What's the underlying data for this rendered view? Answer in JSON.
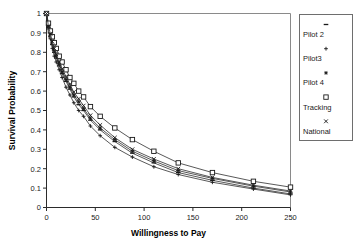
{
  "chart_data": {
    "type": "line",
    "title": "",
    "xlabel": "Willingness to Pay",
    "ylabel": "Survival Probability",
    "xlim": [
      0,
      250
    ],
    "ylim": [
      0,
      1
    ],
    "xticks": [
      0,
      50,
      100,
      150,
      200,
      250
    ],
    "yticks": [
      0,
      0.1,
      0.2,
      0.3,
      0.4,
      0.5,
      0.6,
      0.7,
      0.8,
      0.9,
      1
    ],
    "xticklabels": [
      "0",
      "50",
      "100",
      "150",
      "200",
      "250"
    ],
    "yticklabels": [
      "0",
      "0.1",
      "0.2",
      "0.3",
      "0.4",
      "0.5",
      "0.6",
      "0.7",
      "0.8",
      "0.9",
      "1"
    ],
    "grid": false,
    "legend_position": "outside-right",
    "x": [
      0,
      2,
      4,
      6,
      8,
      10,
      13,
      16,
      20,
      24,
      28,
      33,
      38,
      45,
      55,
      70,
      88,
      110,
      135,
      170,
      212,
      250
    ],
    "series": [
      {
        "name": "Pilot 2",
        "marker": "dash",
        "values": [
          1.0,
          0.93,
          0.88,
          0.84,
          0.8,
          0.77,
          0.73,
          0.69,
          0.65,
          0.61,
          0.57,
          0.53,
          0.5,
          0.45,
          0.4,
          0.34,
          0.28,
          0.23,
          0.18,
          0.14,
          0.1,
          0.07
        ]
      },
      {
        "name": "Pilot3",
        "marker": "plus",
        "values": [
          1.0,
          0.92,
          0.87,
          0.82,
          0.78,
          0.75,
          0.71,
          0.67,
          0.62,
          0.58,
          0.54,
          0.5,
          0.47,
          0.42,
          0.37,
          0.31,
          0.26,
          0.21,
          0.17,
          0.13,
          0.095,
          0.065
        ]
      },
      {
        "name": "Pilot 4",
        "marker": "asterisk",
        "values": [
          1.0,
          0.93,
          0.89,
          0.85,
          0.81,
          0.78,
          0.74,
          0.7,
          0.66,
          0.62,
          0.58,
          0.545,
          0.51,
          0.46,
          0.41,
          0.35,
          0.29,
          0.24,
          0.19,
          0.15,
          0.11,
          0.08
        ]
      },
      {
        "name": "Tracking",
        "marker": "square",
        "values": [
          1.0,
          0.95,
          0.91,
          0.88,
          0.85,
          0.82,
          0.78,
          0.75,
          0.71,
          0.67,
          0.64,
          0.6,
          0.57,
          0.52,
          0.47,
          0.41,
          0.35,
          0.29,
          0.23,
          0.18,
          0.135,
          0.105
        ]
      },
      {
        "name": "National",
        "marker": "x",
        "values": [
          1.0,
          0.935,
          0.895,
          0.855,
          0.82,
          0.79,
          0.75,
          0.715,
          0.675,
          0.635,
          0.595,
          0.56,
          0.525,
          0.475,
          0.425,
          0.36,
          0.3,
          0.25,
          0.2,
          0.155,
          0.115,
          0.085
        ]
      }
    ]
  },
  "legend": {
    "entries": [
      {
        "label": "Pilot 2",
        "marker": "dash-marker"
      },
      {
        "label": "Pilot3",
        "marker": "plus-marker"
      },
      {
        "label": "Pilot 4",
        "marker": "asterisk-marker"
      },
      {
        "label": "Tracking",
        "marker": "square-marker"
      },
      {
        "label": "National",
        "marker": "x-marker"
      }
    ]
  },
  "colors": {
    "line": "#2f2f2f",
    "axis": "#2b2b2b",
    "frame": "#8a8a8a",
    "text": "#1a1a1a",
    "background": "#ffffff"
  }
}
